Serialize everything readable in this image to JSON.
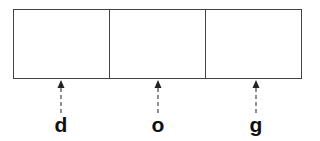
{
  "diagram": {
    "type": "array-cells-with-pointers",
    "cells": [
      {
        "index": 0,
        "content": ""
      },
      {
        "index": 1,
        "content": ""
      },
      {
        "index": 2,
        "content": ""
      }
    ],
    "pointers": [
      {
        "label": "d",
        "target_cell": 0
      },
      {
        "label": "o",
        "target_cell": 1
      },
      {
        "label": "g",
        "target_cell": 2
      }
    ],
    "colors": {
      "stroke": "#444444",
      "label": "#111111",
      "arrow": "#555555"
    }
  }
}
